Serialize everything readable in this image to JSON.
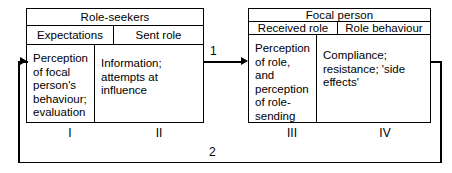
{
  "diagram": {
    "line_color": "#000000",
    "background": "#ffffff",
    "boxes": [
      {
        "id": "role-seekers",
        "title": "Role-seekers",
        "columns": [
          {
            "subheader": "Expectations",
            "body": "Perception of focal person's behaviour; evaluation",
            "numeral": "I"
          },
          {
            "subheader": "Sent role",
            "body": "Information; attempts at influence",
            "numeral": "II"
          }
        ]
      },
      {
        "id": "focal-person",
        "title": "Focal person",
        "columns": [
          {
            "subheader": "Received role",
            "body": "Perception of role, and perception of role-sending",
            "numeral": "III"
          },
          {
            "subheader": "Role behaviour",
            "body": "Compliance; resistance; 'side effects'",
            "numeral": "IV"
          }
        ]
      }
    ],
    "connectors": [
      {
        "id": "connector-1",
        "label": "1",
        "from": "role-seekers",
        "to": "focal-person",
        "direction": "left-to-right"
      },
      {
        "id": "connector-2",
        "label": "2",
        "from": "focal-person",
        "to": "role-seekers",
        "direction": "feedback-loop"
      }
    ]
  }
}
